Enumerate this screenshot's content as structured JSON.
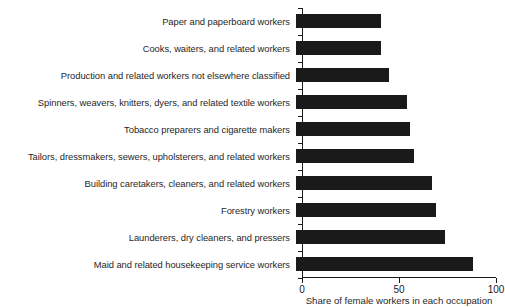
{
  "chart_data": {
    "type": "bar",
    "orientation": "horizontal",
    "title": "",
    "xlabel": "Share of female workers in each occupation",
    "ylabel": "",
    "xlim": [
      0,
      100
    ],
    "xticks": [
      0,
      50,
      100
    ],
    "xticklabels": [
      "0",
      "50",
      "100"
    ],
    "grid": false,
    "legend": null,
    "bar_color": "#1a1a1a",
    "background_color": "#ffffff",
    "categories": [
      "Paper and paperboard workers",
      "Cooks, waiters, and related workers",
      "Production and related workers not elsewhere classified",
      "Spinners, weavers, knitters, dyers, and related textile workers",
      "Tobacco preparers and cigarette makers",
      "Tailors, dressmakers, sewers, upholsterers, and related workers",
      "Building caretakers, cleaners, and related workers",
      "Forestry workers",
      "Launderers, dry cleaners, and pressers",
      "Maid and related housekeeping service workers"
    ],
    "values": [
      44,
      44,
      48,
      57,
      59,
      61,
      70,
      72,
      77,
      91
    ]
  }
}
